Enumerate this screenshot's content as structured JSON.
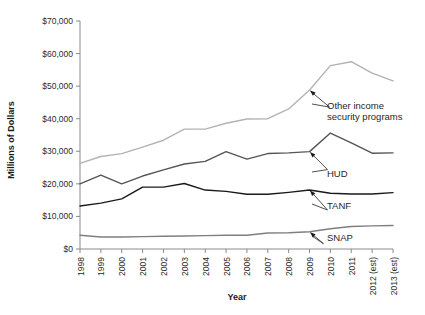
{
  "chart_data": {
    "type": "line",
    "title": "",
    "xlabel": "Year",
    "ylabel": "Millions of Dollars",
    "xlim": [
      1998,
      2013
    ],
    "ylim": [
      0,
      70000
    ],
    "grid": false,
    "legend_position": "inline-annotations",
    "categories": [
      "1998",
      "1999",
      "2000",
      "2001",
      "2002",
      "2003",
      "2004",
      "2005",
      "2006",
      "2007",
      "2008",
      "2009",
      "2010",
      "2011",
      "2012 (est)",
      "2013 (est)"
    ],
    "y_tick_labels": [
      "$0",
      "$10,000",
      "$20,000",
      "$30,000",
      "$40,000",
      "$50,000",
      "$60,000",
      "$70,000"
    ],
    "y_tick_values": [
      0,
      10000,
      20000,
      30000,
      40000,
      50000,
      60000,
      70000
    ],
    "series": [
      {
        "name": "Other income security programs",
        "color": "#b3b3b3",
        "values": [
          26300,
          28400,
          29300,
          31300,
          33400,
          36800,
          36800,
          38600,
          39900,
          40000,
          43000,
          48800,
          56300,
          57500,
          54000,
          51600
        ]
      },
      {
        "name": "HUD",
        "color": "#555555",
        "values": [
          20000,
          22700,
          20000,
          22400,
          24300,
          26100,
          26900,
          29900,
          27600,
          29300,
          29500,
          29900,
          35600,
          32600,
          29400,
          29500
        ]
      },
      {
        "name": "TANF",
        "color": "#1a1a1a",
        "values": [
          13200,
          14100,
          15400,
          19000,
          19000,
          20100,
          18100,
          17700,
          16800,
          16800,
          17400,
          18100,
          17100,
          16900,
          16900,
          17300
        ]
      },
      {
        "name": "SNAP",
        "color": "#7f7f7f",
        "values": [
          4200,
          3700,
          3700,
          3800,
          3900,
          4000,
          4100,
          4200,
          4200,
          4900,
          5000,
          5300,
          6200,
          6900,
          7100,
          7200
        ]
      }
    ],
    "annotations": [
      {
        "label": "Other income",
        "label2": "security programs",
        "series": "Other income security programs",
        "anchor_year": "2009"
      },
      {
        "label": "HUD",
        "label2": "",
        "series": "HUD",
        "anchor_year": "2009"
      },
      {
        "label": "TANF",
        "label2": "",
        "series": "TANF",
        "anchor_year": "2009"
      },
      {
        "label": "SNAP",
        "label2": "",
        "series": "SNAP",
        "anchor_year": "2009"
      }
    ]
  },
  "axes": {
    "x_title": "Year",
    "y_title": "Millions of Dollars"
  }
}
